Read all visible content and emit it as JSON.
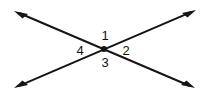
{
  "figure": {
    "background_color": "#ffffff",
    "stroke_color": "#151515",
    "stroke_width": 2,
    "vertex": {
      "x": 104,
      "y": 49,
      "dot_radius": 3
    },
    "lines": [
      {
        "name": "line-northwest-southeast",
        "from": {
          "x": 14,
          "y": 11
        },
        "to": {
          "x": 195,
          "y": 88
        },
        "arrow_start": true,
        "arrow_end": true
      },
      {
        "name": "line-southwest-northeast",
        "from": {
          "x": 14,
          "y": 88
        },
        "to": {
          "x": 196,
          "y": 10
        },
        "arrow_start": true,
        "arrow_end": true
      }
    ],
    "labels": [
      {
        "id": "angle-1",
        "text": "1",
        "x": 105,
        "y": 36,
        "position": "top"
      },
      {
        "id": "angle-2",
        "text": "2",
        "x": 126,
        "y": 51,
        "position": "right"
      },
      {
        "id": "angle-3",
        "text": "3",
        "x": 105,
        "y": 63,
        "position": "bottom"
      },
      {
        "id": "angle-4",
        "text": "4",
        "x": 80,
        "y": 51,
        "position": "left"
      }
    ]
  }
}
